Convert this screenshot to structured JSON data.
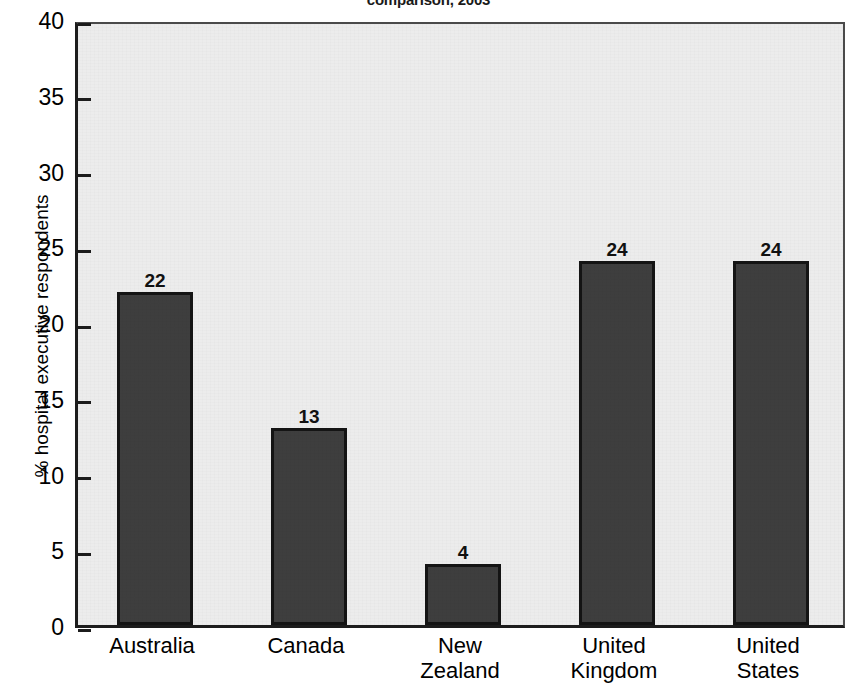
{
  "title": "comparison, 2003",
  "chart_data": {
    "type": "bar",
    "title": "comparison, 2003",
    "xlabel": "",
    "ylabel": "% hospital executive respondents",
    "ylim": [
      0,
      40
    ],
    "yticks": [
      "0",
      "5",
      "10",
      "15",
      "20",
      "25",
      "30",
      "35",
      "40"
    ],
    "grid": false,
    "legend": "none",
    "categories": [
      "Australia",
      "Canada",
      "New Zealand",
      "United Kingdom",
      "United States"
    ],
    "category_lines": [
      [
        "Australia"
      ],
      [
        "Canada"
      ],
      [
        "New",
        "Zealand"
      ],
      [
        "United",
        "Kingdom"
      ],
      [
        "United",
        "States"
      ]
    ],
    "values": [
      22,
      13,
      4,
      24,
      24
    ],
    "value_labels": [
      "22",
      "13",
      "4",
      "24",
      "24"
    ],
    "bar_color": "#3e3e3e",
    "bar_border_color": "#141414",
    "plot_background": "#ececec",
    "page_background": "#ffffff",
    "axis_color": "#1c1c1c"
  }
}
